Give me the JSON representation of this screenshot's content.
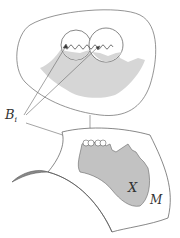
{
  "diagram": {
    "labels": {
      "balls": "B",
      "balls_subscript": "i",
      "region": "X",
      "manifold": "M"
    },
    "colors": {
      "stroke": "#555555",
      "fill_region": "#c8c8c8",
      "fill_inner": "#d9d9d9",
      "strip_fill": "#999999",
      "background": "#ffffff"
    }
  }
}
